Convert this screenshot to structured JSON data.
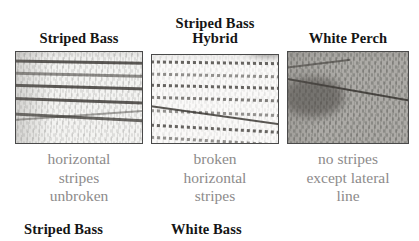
{
  "figure": {
    "background_color": "#ffffff",
    "title_color": "#151515",
    "caption_color": "#8d8b8b",
    "panel_border_color": "#4a4a4a"
  },
  "panels": [
    {
      "id": "striped-bass",
      "title": "Striped Bass",
      "caption": "horizontal\nstripes\nunbroken",
      "photo_alt": "striped-bass-scales-photo",
      "stripe_style": "solid"
    },
    {
      "id": "striped-bass-hybrid",
      "title": "Striped Bass\nHybrid",
      "caption": "broken\nhorizontal\nstripes",
      "photo_alt": "striped-bass-hybrid-scales-photo",
      "stripe_style": "broken"
    },
    {
      "id": "white-perch",
      "title": "White Perch",
      "caption": "no stripes\nexcept lateral\nline",
      "photo_alt": "white-perch-scales-photo",
      "stripe_style": "none"
    }
  ],
  "bottom_row": {
    "labels": [
      {
        "id": "striped-bass-bottom",
        "text": "Striped Bass"
      },
      {
        "id": "white-bass-bottom",
        "text": "White Bass"
      }
    ]
  }
}
